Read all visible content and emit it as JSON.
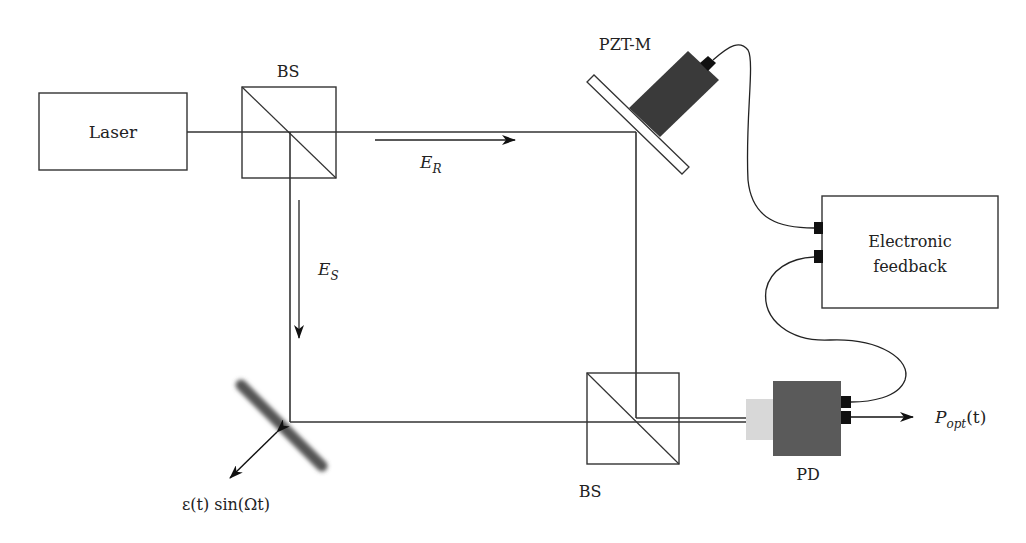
{
  "diagram": {
    "type": "optical-interferometer-schematic",
    "components": {
      "laser": {
        "label": "Laser"
      },
      "beam_splitter_top": {
        "label": "BS"
      },
      "beam_splitter_bottom": {
        "label": "BS"
      },
      "pzt_mirror": {
        "label": "PZT-M"
      },
      "feedback": {
        "line1": "Electronic",
        "line2": "feedback"
      },
      "photodetector": {
        "label": "PD"
      },
      "vibrating_mirror": {
        "label": "ε(t) sin(Ωt)"
      }
    },
    "beams": {
      "reference": {
        "symbol": "E",
        "subscript": "R"
      },
      "signal": {
        "symbol": "E",
        "subscript": "S"
      },
      "output": {
        "symbol": "P",
        "subscript": "opt",
        "suffix": "(t)"
      }
    },
    "colors": {
      "line": "#333333",
      "pzt_body": "#3a3a3a",
      "pd_body": "#5a5a5a",
      "pd_window": "#d8d8d8",
      "connector": "#111111",
      "background": "#ffffff"
    }
  }
}
